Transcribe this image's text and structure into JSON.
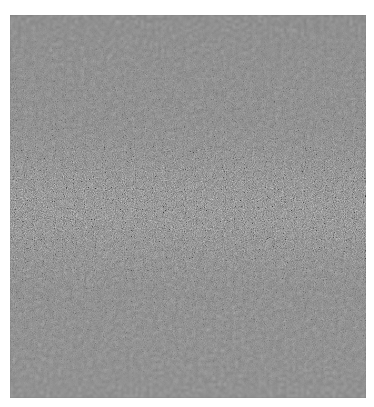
{
  "image": {
    "description": "Close-up photo of a gray textured surface (carpet or fabric), grainy speckled pattern with a sharp focus band across the middle and soft blur toward the top and bottom",
    "colors": {
      "background": "#ffffff",
      "base_gray": "#7a7a7a",
      "dark_speck": "#3a3a3a",
      "light_speck": "#bdbdbd"
    }
  }
}
